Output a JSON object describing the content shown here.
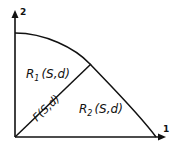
{
  "diagram": {
    "axes": {
      "x_label": "1",
      "y_label": "2"
    },
    "regions": {
      "r1": {
        "name": "R",
        "sub": "1",
        "args": "(S,d)"
      },
      "r2": {
        "name": "R",
        "sub": "2",
        "args": "(S,d)"
      }
    },
    "frontier_split": {
      "label": "F(S,d)"
    },
    "colors": {
      "ink": "#111111",
      "background": "#ffffff"
    }
  }
}
